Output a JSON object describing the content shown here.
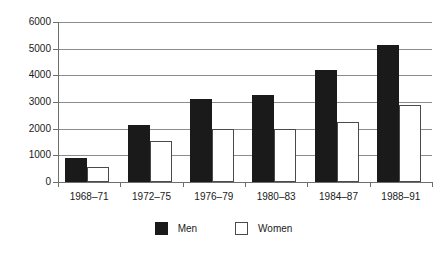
{
  "chart_data": {
    "type": "bar",
    "title": "",
    "subtitle": "",
    "xlabel": "",
    "ylabel": "",
    "categories": [
      "1968–71",
      "1972–75",
      "1976–79",
      "1980–83",
      "1984–87",
      "1988–91"
    ],
    "series": [
      {
        "name": "Men",
        "color": "#1a1a1a",
        "values": [
          900,
          2150,
          3100,
          3250,
          4200,
          5150
        ]
      },
      {
        "name": "Women",
        "color": "#ffffff",
        "values": [
          550,
          1550,
          2000,
          2000,
          2250,
          2880
        ]
      }
    ],
    "ylim": [
      0,
      6000
    ],
    "yticks": [
      0,
      1000,
      2000,
      3000,
      4000,
      5000,
      6000
    ],
    "ytick_labels": [
      "0",
      "1000",
      "2000",
      "3000",
      "4000",
      "5000",
      "6000"
    ],
    "grid": true,
    "grid_axis": "y",
    "legend_position": "bottom-center",
    "legend_entries": [
      {
        "label": "Men",
        "swatch": "filled-black-square"
      },
      {
        "label": "Women",
        "swatch": "outlined-white-square"
      }
    ],
    "frame": false,
    "colors": {
      "men_fill": "#1a1a1a",
      "women_fill": "#ffffff",
      "women_stroke": "#4a4a4a",
      "gridline": "#8c8c8c",
      "axis": "#6e6e6e",
      "text": "#1a1a1a",
      "background": "#ffffff"
    }
  }
}
